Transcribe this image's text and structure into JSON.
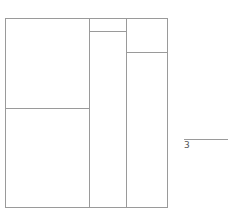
{
  "diagram": {
    "type": "treemap-like partition",
    "outer": {
      "left": 5,
      "top": 18,
      "right": 167,
      "bottom": 208
    },
    "columns": [
      {
        "name": "left",
        "x0": 5,
        "x1": 89,
        "split_y": 108
      },
      {
        "name": "middle",
        "x0": 89,
        "x1": 126,
        "split_y": 31
      },
      {
        "name": "right",
        "x0": 126,
        "x1": 167,
        "split_y": 52
      }
    ],
    "line_color": "#9a9a9a"
  },
  "legend": {
    "label": "3",
    "line": {
      "x0": 184,
      "x1": 228,
      "y": 139
    }
  }
}
